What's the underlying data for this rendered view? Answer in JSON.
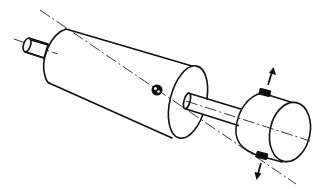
{
  "diagram": {
    "components": [
      {
        "id": "input-shaft",
        "label": "Input shaft stub"
      },
      {
        "id": "large-cylinder",
        "label": "Large cylinder (driver)"
      },
      {
        "id": "pivot-ball",
        "label": "Pivot / ball joint"
      },
      {
        "id": "connecting-shaft",
        "label": "Connecting shaft"
      },
      {
        "id": "small-cylinder",
        "label": "Small cylinder (driven)"
      },
      {
        "id": "top-clamp",
        "label": "Top adjustment block"
      },
      {
        "id": "bottom-clamp",
        "label": "Bottom adjustment block"
      }
    ],
    "arrows": [
      {
        "id": "arrow-up",
        "direction": "up"
      },
      {
        "id": "arrow-down",
        "direction": "down"
      }
    ],
    "axes": [
      {
        "id": "center-axis",
        "style": "dash-dot"
      },
      {
        "id": "misaligned-axis",
        "style": "dash-dot"
      }
    ],
    "colors": {
      "line": "#111111",
      "background": "#ffffff"
    }
  }
}
